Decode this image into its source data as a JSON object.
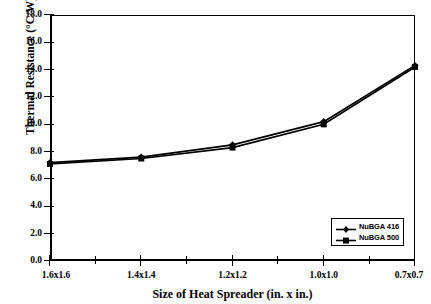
{
  "chart_data": {
    "type": "line",
    "title": "",
    "xlabel": "Size of Heat Spreader (in. x in.)",
    "ylabel": "Thermal Resistance (°C/W)",
    "categories": [
      "1.6x1.6",
      "1.4x1.4",
      "1.2x1.2",
      "1.0x1.0",
      "0.7x0.7"
    ],
    "series": [
      {
        "name": "NuBGA 416",
        "marker": "diamond",
        "values": [
          7.2,
          7.6,
          8.5,
          10.2,
          14.3
        ]
      },
      {
        "name": "NuBGA 500",
        "marker": "square",
        "values": [
          7.1,
          7.5,
          8.3,
          10.0,
          14.2
        ]
      }
    ],
    "ylim": [
      0.0,
      18.0
    ],
    "ytick_labels": [
      "0.0",
      "2.0",
      "4.0",
      "6.0",
      "8.0",
      "10.0",
      "12.0",
      "14.0",
      "16.0",
      "18.0"
    ],
    "ytick_values": [
      0.0,
      2.0,
      4.0,
      6.0,
      8.0,
      10.0,
      12.0,
      14.0,
      16.0,
      18.0
    ],
    "grid": false,
    "legend_position": "lower-right",
    "line_color": "#000000",
    "background_color": "#ffffff"
  },
  "axes": {
    "y_title": "Thermal Resistance (°C/W)",
    "x_title": "Size of Heat Spreader (in. x in.)"
  },
  "legend": {
    "entries": [
      {
        "label": "NuBGA 416"
      },
      {
        "label": "NuBGA 500"
      }
    ]
  }
}
